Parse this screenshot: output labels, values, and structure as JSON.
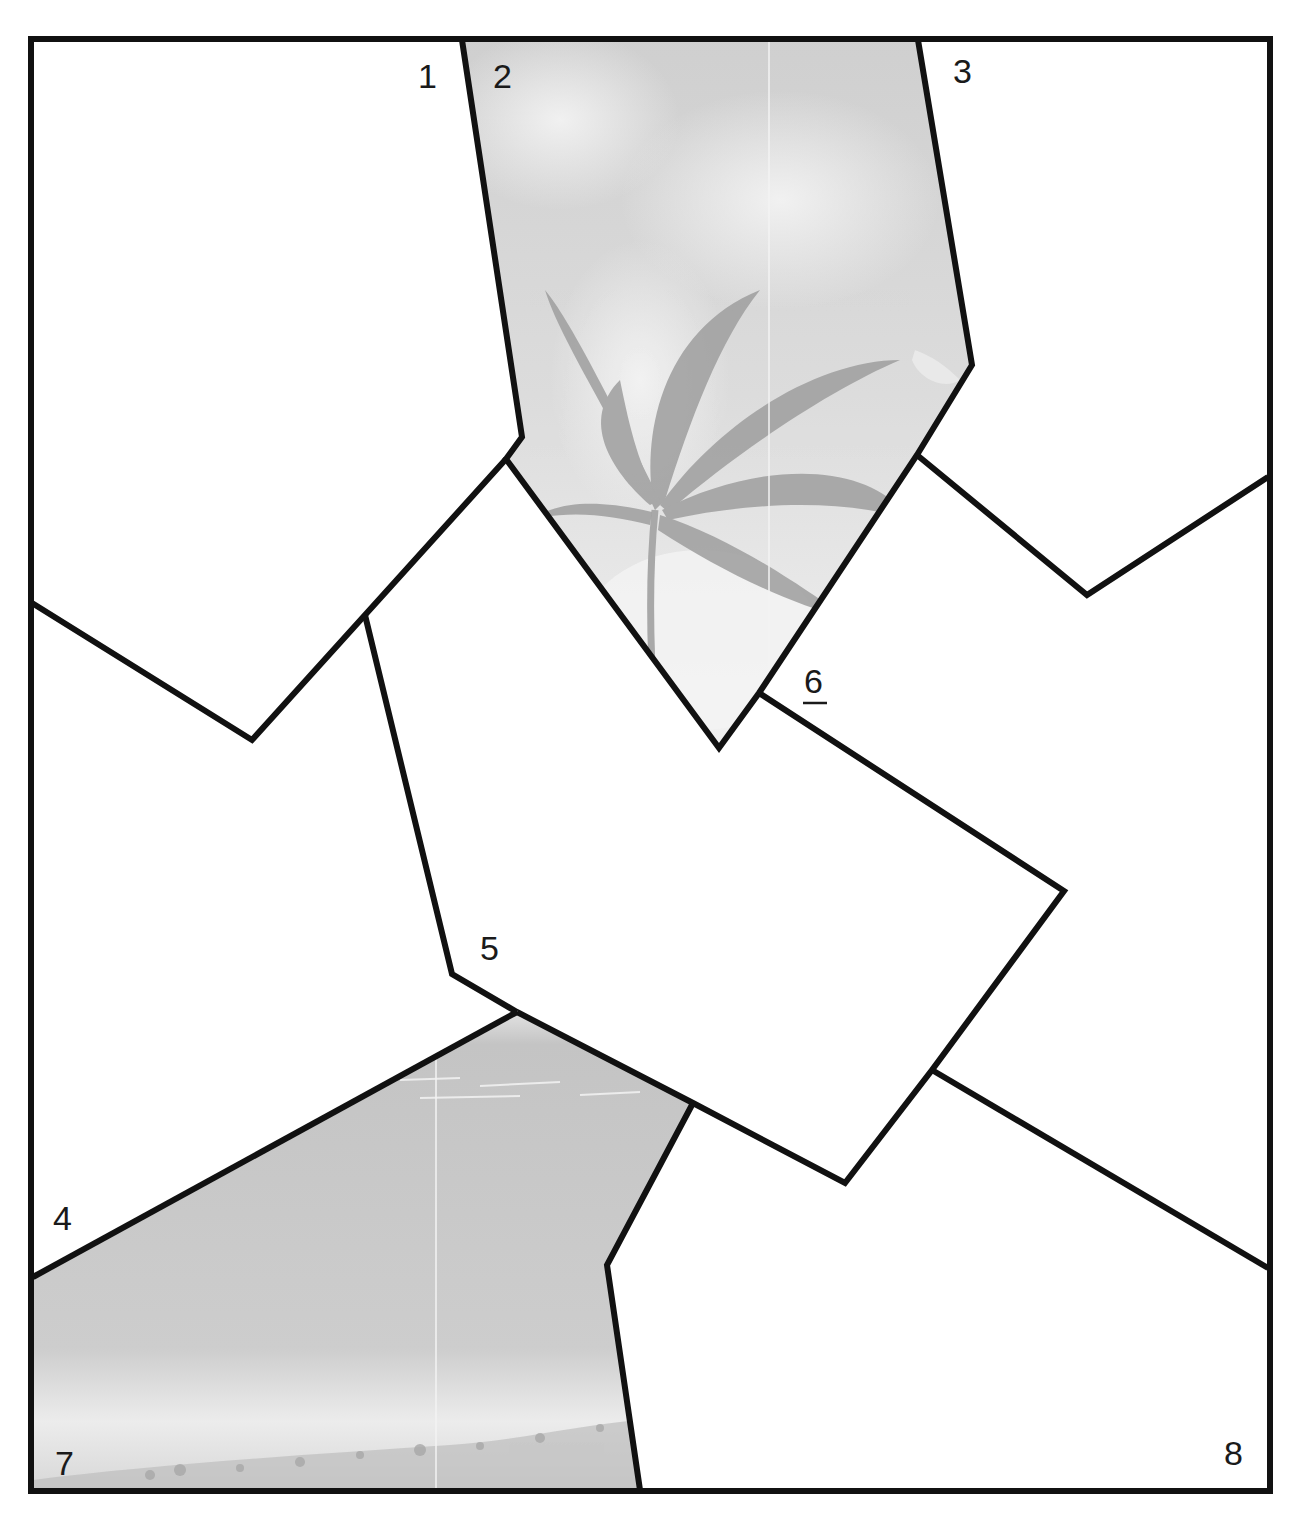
{
  "figure": {
    "type": "puzzle-region-map",
    "stroke_color": "#111111",
    "fill_white": "#ffffff",
    "photo_tint": "#c9c9c9",
    "regions": [
      {
        "id": "1",
        "label": "1",
        "content": "blank"
      },
      {
        "id": "2",
        "label": "2",
        "content": "photo: wind-blown palm tree against cloudy sky"
      },
      {
        "id": "3",
        "label": "3",
        "content": "blank"
      },
      {
        "id": "4",
        "label": "4",
        "content": "blank"
      },
      {
        "id": "5",
        "label": "5",
        "content": "blank"
      },
      {
        "id": "6",
        "label": "6",
        "content": "blank",
        "underlined": true
      },
      {
        "id": "7",
        "label": "7",
        "content": "photo: ocean waves and beach shoreline"
      },
      {
        "id": "8",
        "label": "8",
        "content": "blank"
      }
    ]
  }
}
